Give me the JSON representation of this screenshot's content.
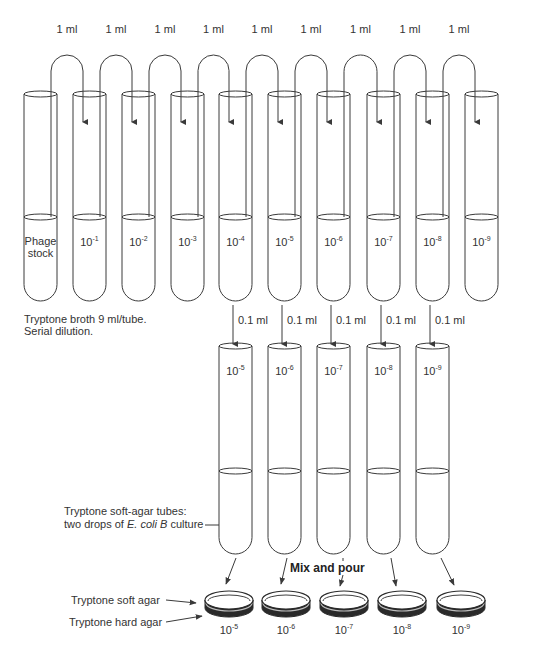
{
  "diagram": {
    "colors": {
      "line": "#3a3a3a",
      "text": "#333333",
      "background": "#ffffff",
      "agar_dark": "#2a2a2a"
    },
    "transfer_top": {
      "label": "1 ml",
      "count": 9
    },
    "top_tubes": [
      {
        "label": "Phage stock",
        "line1": "Phage",
        "line2": "stock"
      },
      {
        "base": "10",
        "exp": "-1"
      },
      {
        "base": "10",
        "exp": "-2"
      },
      {
        "base": "10",
        "exp": "-3"
      },
      {
        "base": "10",
        "exp": "-4"
      },
      {
        "base": "10",
        "exp": "-5"
      },
      {
        "base": "10",
        "exp": "-6"
      },
      {
        "base": "10",
        "exp": "-7"
      },
      {
        "base": "10",
        "exp": "-8"
      },
      {
        "base": "10",
        "exp": "-9"
      }
    ],
    "broth_note": {
      "line1": "Tryptone broth 9 ml/tube.",
      "line2": "Serial dilution."
    },
    "transfer_mid": {
      "label": "0.1 ml",
      "count": 5
    },
    "bottom_tubes": [
      {
        "base": "10",
        "exp": "-5"
      },
      {
        "base": "10",
        "exp": "-6"
      },
      {
        "base": "10",
        "exp": "-7"
      },
      {
        "base": "10",
        "exp": "-8"
      },
      {
        "base": "10",
        "exp": "-9"
      }
    ],
    "soft_agar_note": {
      "line1": "Tryptone soft-agar tubes:",
      "line2_prefix": "two drops of ",
      "line2_italic": "E. coli B",
      "line2_suffix": " culture"
    },
    "mix_label": "Mix and pour",
    "plates": [
      {
        "base": "10",
        "exp": "-5"
      },
      {
        "base": "10",
        "exp": "-6"
      },
      {
        "base": "10",
        "exp": "-7"
      },
      {
        "base": "10",
        "exp": "-8"
      },
      {
        "base": "10",
        "exp": "-9"
      }
    ],
    "plate_labels": {
      "soft": "Tryptone soft agar",
      "hard": "Tryptone hard agar"
    }
  }
}
